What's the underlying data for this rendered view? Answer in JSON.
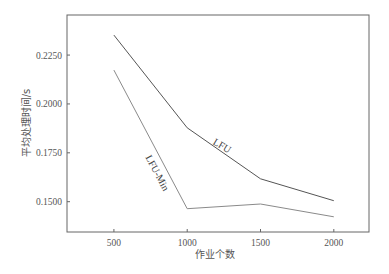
{
  "chart_data": {
    "type": "line",
    "title": "",
    "xlabel": "作业个数",
    "ylabel": "平均处理时间/s",
    "x": [
      500,
      1000,
      1500,
      2000
    ],
    "x_ticks": [
      "500",
      "1000",
      "1500",
      "2000"
    ],
    "y_ticks": [
      "0.1500",
      "0.1750",
      "0.2000",
      "0.2250"
    ],
    "xlim": [
      180,
      2240
    ],
    "ylim": [
      0.1345,
      0.2455
    ],
    "grid": false,
    "legend": "inline labels on lines",
    "series": [
      {
        "name": "LFU",
        "values": [
          0.2352,
          0.1878,
          0.1617,
          0.1505
        ],
        "color": "#555555"
      },
      {
        "name": "LFU-Min",
        "values": [
          0.2173,
          0.1464,
          0.1488,
          0.1423
        ],
        "color": "#8a8a8a"
      }
    ]
  },
  "labels": {
    "lfu": "LFU",
    "lfu_min": "LFU-Min",
    "xlabel": "作业个数",
    "ylabel": "平均处理时间/s"
  }
}
